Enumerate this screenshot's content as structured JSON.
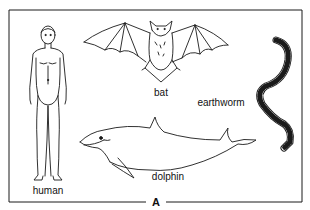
{
  "figure": {
    "panel_label": "A",
    "animals": [
      {
        "name": "human",
        "label": "human"
      },
      {
        "name": "bat",
        "label": "bat"
      },
      {
        "name": "earthworm",
        "label": "earthworm"
      },
      {
        "name": "dolphin",
        "label": "dolphin"
      }
    ]
  },
  "colors": {
    "stroke": "#1a1a1a",
    "background": "#ffffff"
  }
}
